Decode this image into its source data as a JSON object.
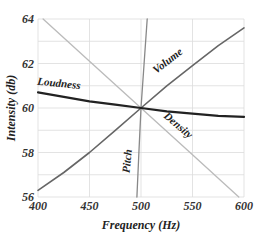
{
  "chart_data": {
    "type": "line",
    "title": "",
    "xlabel": "Frequency (Hz)",
    "ylabel": "Intensity (db)",
    "xlim": [
      400,
      600
    ],
    "ylim": [
      56,
      64
    ],
    "x_ticks": [
      "400",
      "450",
      "500",
      "550",
      "600"
    ],
    "y_ticks": [
      "56",
      "58",
      "60",
      "62",
      "64"
    ],
    "grid": true,
    "legend": "inline labels",
    "series": [
      {
        "name": "Loudness",
        "color": "#222222",
        "width": 2.2,
        "points": [
          [
            400,
            60.7
          ],
          [
            425,
            60.5
          ],
          [
            450,
            60.3
          ],
          [
            475,
            60.15
          ],
          [
            500,
            60.0
          ],
          [
            525,
            59.85
          ],
          [
            550,
            59.75
          ],
          [
            575,
            59.65
          ],
          [
            600,
            59.6
          ]
        ],
        "label_pos": [
          420,
          60.95
        ],
        "label_rotate": 6
      },
      {
        "name": "Volume",
        "color": "#666666",
        "width": 1.6,
        "points": [
          [
            400,
            56.3
          ],
          [
            425,
            57.1
          ],
          [
            450,
            58.0
          ],
          [
            475,
            59.0
          ],
          [
            500,
            60.0
          ],
          [
            525,
            61.0
          ],
          [
            550,
            61.9
          ],
          [
            575,
            62.8
          ],
          [
            600,
            63.6
          ]
        ],
        "label_pos": [
          528,
          62.0
        ],
        "label_rotate": -38
      },
      {
        "name": "Density",
        "color": "#bbbbbb",
        "width": 1.3,
        "points": [
          [
            405,
            64.0
          ],
          [
            450,
            62.1
          ],
          [
            500,
            60.0
          ],
          [
            550,
            57.9
          ],
          [
            595,
            56.0
          ]
        ],
        "label_pos": [
          534,
          59.1
        ],
        "label_rotate": 40
      },
      {
        "name": "Pitch",
        "color": "#888888",
        "width": 1.3,
        "points": [
          [
            496,
            56.0
          ],
          [
            498,
            58.0
          ],
          [
            500,
            60.0
          ],
          [
            503,
            62.0
          ],
          [
            506,
            64.0
          ]
        ],
        "label_pos": [
          490,
          57.6
        ],
        "label_rotate": -84
      }
    ]
  }
}
